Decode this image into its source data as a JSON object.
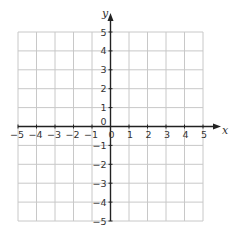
{
  "chart_data": {
    "type": "coordinate-grid",
    "title": "",
    "xlabel": "x",
    "ylabel": "y",
    "xlim": [
      -5,
      5
    ],
    "ylim": [
      -5,
      5
    ],
    "grid": true,
    "x_ticks": [
      -5,
      -4,
      -3,
      -2,
      -1,
      0,
      1,
      2,
      3,
      4,
      5
    ],
    "y_ticks": [
      -5,
      -4,
      -3,
      -2,
      -1,
      0,
      1,
      2,
      3,
      4,
      5
    ],
    "x_tick_labels": [
      "−5",
      "−4",
      "−3",
      "−2",
      "−1",
      "0",
      "1",
      "2",
      "3",
      "4",
      "5"
    ],
    "y_tick_labels": [
      "−5",
      "−4",
      "−3",
      "−2",
      "−1",
      "0",
      "1",
      "2",
      "3",
      "4",
      "5"
    ],
    "series": []
  },
  "axes": {
    "x_name": "x",
    "y_name": "y"
  },
  "colors": {
    "grid": "#c8c8c8",
    "axis": "#222222",
    "label": "#333333"
  }
}
